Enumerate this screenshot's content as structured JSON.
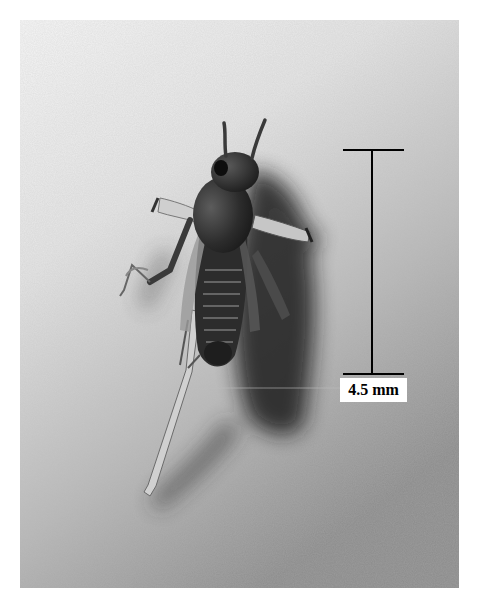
{
  "figure": {
    "scale_bar": {
      "label": "4.5 mm",
      "color": "#000000"
    },
    "colors": {
      "background_light": "#f4f4f4",
      "background_dark": "#8a8a8a",
      "insect": "#2e2e2e",
      "shadow": "#1a1a1a"
    }
  }
}
